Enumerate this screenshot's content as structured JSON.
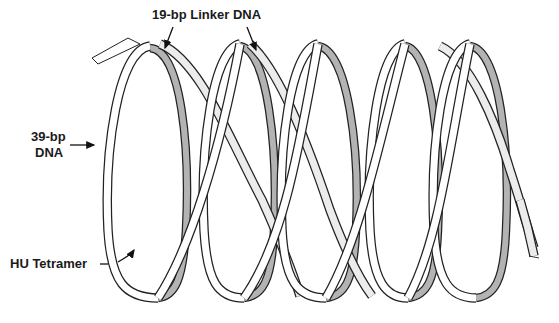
{
  "figure": {
    "type": "schematic",
    "colors": {
      "ribbon_front": "#ffffff",
      "ribbon_back": "#b3b3b3",
      "ribbon_linker": "#ececec",
      "outline": "#222222",
      "background": "#ffffff"
    },
    "turns": 5
  },
  "labels": {
    "linker": "19-bp Linker DNA",
    "dna_line1": "39-bp",
    "dna_line2": "DNA",
    "tetramer": "HU Tetramer"
  }
}
